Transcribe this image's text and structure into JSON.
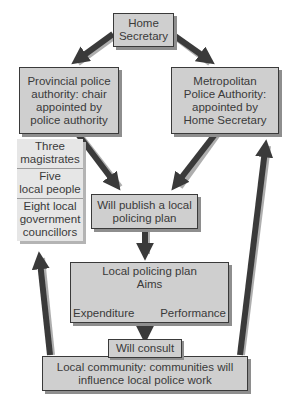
{
  "nodes": {
    "home_secretary": {
      "lines": [
        "Home",
        "Secretary"
      ]
    },
    "provincial": {
      "lines": [
        "Provincial police",
        "authority: chair",
        "appointed by",
        "police authority"
      ]
    },
    "metropolitan": {
      "lines": [
        "Metropolitan",
        "Police Authority:",
        "appointed by",
        "Home Secretary"
      ]
    },
    "composition": [
      {
        "lines": [
          "Three",
          "magistrates"
        ]
      },
      {
        "lines": [
          "Five",
          "local people"
        ]
      },
      {
        "lines": [
          "Eight local",
          "government",
          "councillors"
        ]
      }
    ],
    "publish_plan": {
      "lines": [
        "Will publish a local",
        "policing plan"
      ]
    },
    "local_plan": {
      "title": "Local policing plan",
      "aims": "Aims",
      "expenditure": "Expenditure",
      "performance": "Performance"
    },
    "will_consult": {
      "label": "Will consult"
    },
    "local_community": {
      "lines": [
        "Local community: communities will",
        "influence local police work"
      ]
    }
  },
  "edges": [
    {
      "from": "home_secretary",
      "to": "provincial"
    },
    {
      "from": "home_secretary",
      "to": "metropolitan"
    },
    {
      "from": "provincial",
      "to": "publish_plan"
    },
    {
      "from": "metropolitan",
      "to": "publish_plan"
    },
    {
      "from": "publish_plan",
      "to": "local_plan"
    },
    {
      "from": "local_plan",
      "to": "will_consult"
    },
    {
      "from": "local_community",
      "to": "composition"
    },
    {
      "from": "local_community",
      "to": "metropolitan"
    },
    {
      "from": "aims",
      "to": "expenditure"
    },
    {
      "from": "expenditure",
      "to": "performance"
    },
    {
      "from": "performance",
      "to": "aims"
    }
  ],
  "colors": {
    "box_fill": "#cfcfcf",
    "stack_fill": "#e6e6e6",
    "arrow": "#3a3a3a",
    "shadow": "#8e8e8e"
  }
}
